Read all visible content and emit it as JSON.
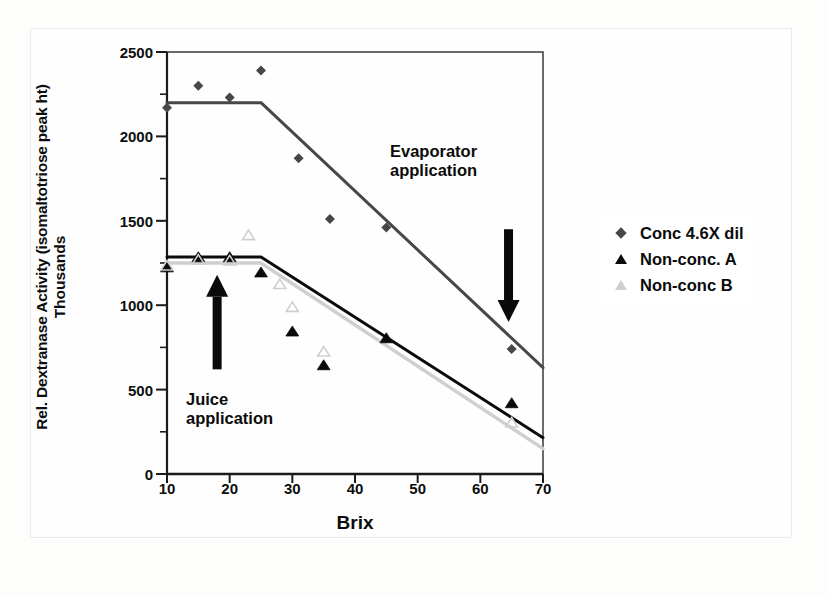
{
  "chart_data": {
    "type": "scatter",
    "title": "",
    "xlabel": "Brix",
    "ylabel": "Rel. Dextranase Activity (isomaltotriose peak ht)",
    "ylabel_secondary": "Thousands",
    "xlim": [
      10,
      70
    ],
    "ylim": [
      0,
      2500
    ],
    "x_ticks": [
      10,
      20,
      30,
      40,
      50,
      60,
      70
    ],
    "y_ticks": [
      0,
      500,
      1000,
      1500,
      2000,
      2500
    ],
    "y_minor_ticks": [
      250,
      750,
      1250,
      1750,
      2250
    ],
    "grid": false,
    "legend_position": "right",
    "series": [
      {
        "name": "Conc 4.6X dil",
        "marker": "diamond",
        "color": "#474747",
        "points": [
          {
            "x": 10,
            "y": 2170
          },
          {
            "x": 15,
            "y": 2300
          },
          {
            "x": 20,
            "y": 2230
          },
          {
            "x": 25,
            "y": 2390
          },
          {
            "x": 31,
            "y": 1870
          },
          {
            "x": 36,
            "y": 1510
          },
          {
            "x": 45,
            "y": 1460
          },
          {
            "x": 65,
            "y": 740
          }
        ],
        "trend": [
          {
            "x": 10,
            "y": 2200
          },
          {
            "x": 25,
            "y": 2200
          },
          {
            "x": 70,
            "y": 630
          }
        ]
      },
      {
        "name": "Non-conc. A",
        "marker": "triangle-filled",
        "color": "#0a0a0a",
        "points": [
          {
            "x": 10,
            "y": 1220
          },
          {
            "x": 15,
            "y": 1280
          },
          {
            "x": 20,
            "y": 1280
          },
          {
            "x": 25,
            "y": 1190
          },
          {
            "x": 30,
            "y": 840
          },
          {
            "x": 35,
            "y": 640
          },
          {
            "x": 45,
            "y": 800
          },
          {
            "x": 65,
            "y": 415
          }
        ],
        "trend": [
          {
            "x": 10,
            "y": 1285
          },
          {
            "x": 25,
            "y": 1285
          },
          {
            "x": 70,
            "y": 215
          }
        ]
      },
      {
        "name": "Non-conc B",
        "marker": "triangle-light",
        "color": "#cfcfcf",
        "points": [
          {
            "x": 10,
            "y": 1230
          },
          {
            "x": 15,
            "y": 1265
          },
          {
            "x": 20,
            "y": 1260
          },
          {
            "x": 23,
            "y": 1410
          },
          {
            "x": 28,
            "y": 1120
          },
          {
            "x": 30,
            "y": 985
          },
          {
            "x": 35,
            "y": 720
          },
          {
            "x": 65,
            "y": 300
          }
        ],
        "trend": [
          {
            "x": 10,
            "y": 1250
          },
          {
            "x": 25,
            "y": 1250
          },
          {
            "x": 70,
            "y": 150
          }
        ]
      }
    ],
    "annotations": [
      {
        "id": "evaporator",
        "text": "Evaporator\napplication",
        "arrow_direction": "down",
        "arrow_x": 64.5,
        "arrow_y_from": 1450,
        "arrow_y_to": 900
      },
      {
        "id": "juice",
        "text": "Juice\napplication",
        "arrow_direction": "up",
        "arrow_x": 18,
        "arrow_y_from": 620,
        "arrow_y_to": 1180
      }
    ]
  },
  "legend": {
    "items": [
      {
        "label": "Conc 4.6X dil",
        "marker": "diamond"
      },
      {
        "label": "Non-conc. A",
        "marker": "triangle-filled"
      },
      {
        "label": "Non-conc B",
        "marker": "triangle-light"
      }
    ]
  },
  "axis_titles": {
    "y_main": "Rel. Dextranase Activity (isomaltotriose peak ht)",
    "y_secondary": "Thousands",
    "x_main": "Brix"
  },
  "annotations": {
    "evaporator": "Evaporator\napplication",
    "juice": "Juice\napplication"
  },
  "colors": {
    "series_conc": "#474747",
    "series_nonconc_a": "#0a0a0a",
    "series_nonconc_b": "#cfcfcf",
    "axis": "#1a1a1a",
    "background": "#fefefe"
  }
}
